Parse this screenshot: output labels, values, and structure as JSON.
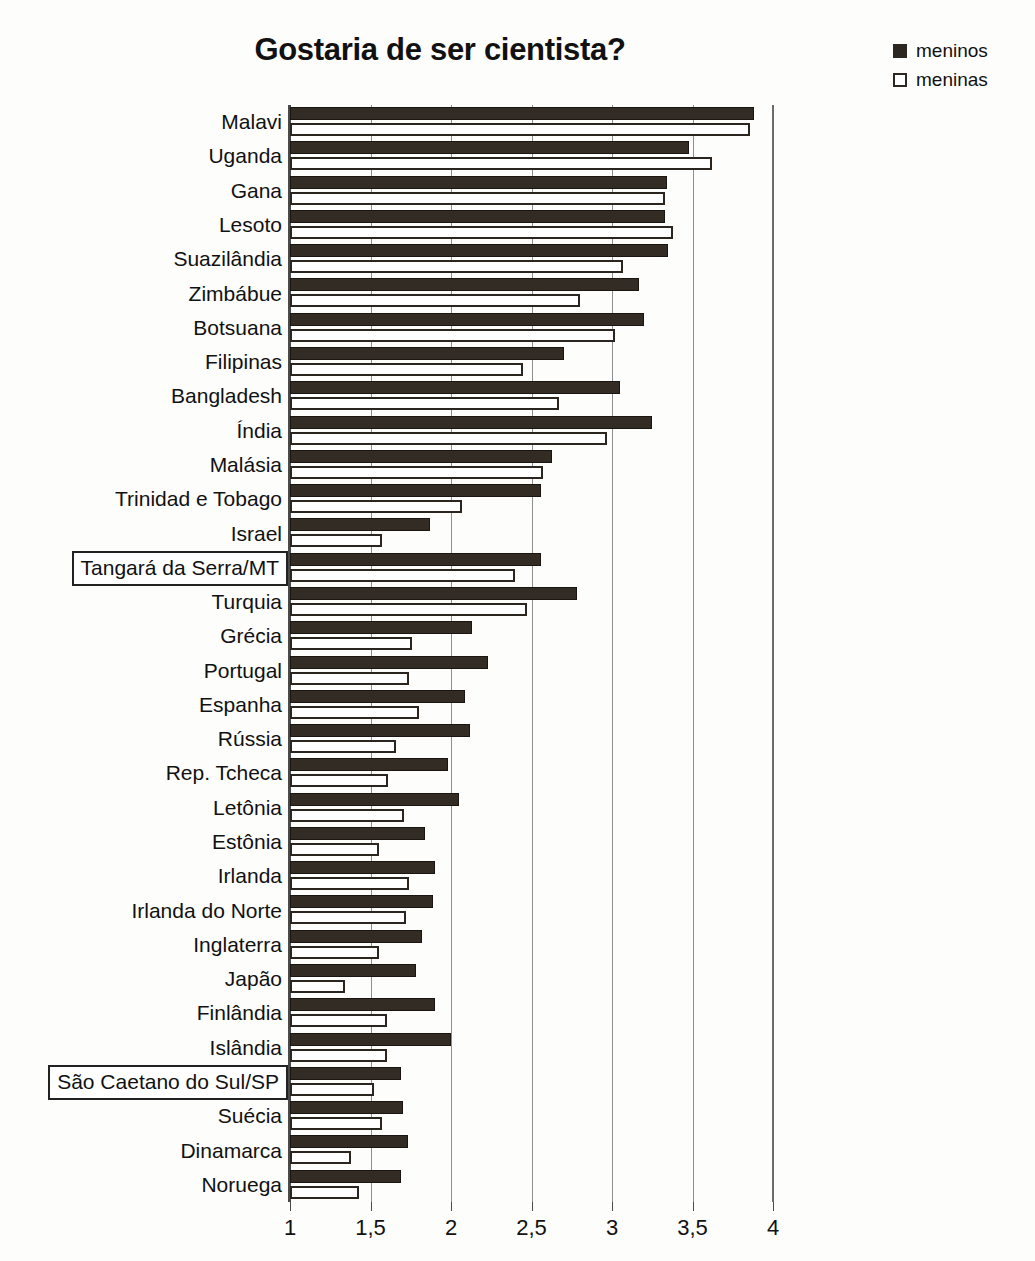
{
  "scan_artifact_text": "",
  "chart_data": {
    "type": "bar",
    "orientation": "horizontal",
    "title": "Gostaria de ser cientista?",
    "xlabel": "",
    "ylabel": "",
    "xlim": [
      1,
      4
    ],
    "xticks": [
      1,
      1.5,
      2,
      2.5,
      3,
      3.5,
      4
    ],
    "xtick_labels": [
      "1",
      "1,5",
      "2",
      "2,5",
      "3",
      "3,5",
      "4"
    ],
    "grid": true,
    "legend_position": "top-right",
    "legend": [
      "meninos",
      "meninas"
    ],
    "colors": {
      "meninos": "#332c25",
      "meninas": "#ffffff",
      "outline": "#2b2520"
    },
    "categories": [
      "Malavi",
      "Uganda",
      "Gana",
      "Lesoto",
      "Suazilândia",
      "Zimbábue",
      "Botsuana",
      "Filipinas",
      "Bangladesh",
      "Índia",
      "Malásia",
      "Trinidad e Tobago",
      "Israel",
      "Tangará da Serra/MT",
      "Turquia",
      "Grécia",
      "Portugal",
      "Espanha",
      "Rússia",
      "Rep. Tcheca",
      "Letônia",
      "Estônia",
      "Irlanda",
      "Irlanda do Norte",
      "Inglaterra",
      "Japão",
      "Finlândia",
      "Islândia",
      "São Caetano do Sul/SP",
      "Suécia",
      "Dinamarca",
      "Noruega"
    ],
    "highlighted_categories": [
      "Tangará da Serra/MT",
      "São Caetano do Sul/SP"
    ],
    "series": [
      {
        "name": "meninos",
        "values": [
          3.88,
          3.48,
          3.34,
          3.33,
          3.35,
          3.17,
          3.2,
          2.7,
          3.05,
          3.25,
          2.63,
          2.56,
          1.87,
          2.56,
          2.78,
          2.13,
          2.23,
          2.09,
          2.12,
          1.98,
          2.05,
          1.84,
          1.9,
          1.89,
          1.82,
          1.78,
          1.9,
          2.0,
          1.69,
          1.7,
          1.73,
          1.69
        ]
      },
      {
        "name": "meninas",
        "values": [
          3.86,
          3.62,
          3.33,
          3.38,
          3.07,
          2.8,
          3.02,
          2.45,
          2.67,
          2.97,
          2.57,
          2.07,
          1.57,
          2.4,
          2.47,
          1.76,
          1.74,
          1.8,
          1.66,
          1.61,
          1.71,
          1.55,
          1.74,
          1.72,
          1.55,
          1.34,
          1.6,
          1.6,
          1.52,
          1.57,
          1.38,
          1.43
        ]
      }
    ]
  }
}
